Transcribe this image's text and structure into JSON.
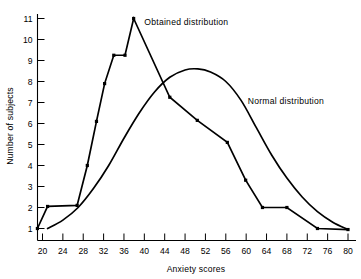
{
  "chart_data": {
    "type": "line",
    "title": "",
    "xlabel": "Anxiety scores",
    "ylabel": "Number of subjects",
    "xlim": [
      18,
      82
    ],
    "ylim": [
      0.2,
      11.6
    ],
    "grid": false,
    "legend_position": "inline-annotations",
    "xticks": [
      20,
      24,
      28,
      32,
      36,
      40,
      44,
      48,
      52,
      56,
      60,
      64,
      68,
      72,
      76,
      80
    ],
    "yticks": [
      1,
      2,
      3,
      4,
      5,
      6,
      7,
      8,
      9,
      10,
      11
    ],
    "xtick_labels": [
      "20",
      "24",
      "28",
      "32",
      "36",
      "40",
      "44",
      "48",
      "52",
      "56",
      "60",
      "64",
      "68",
      "72",
      "76",
      "80"
    ],
    "ytick_labels": [
      "1",
      "2",
      "3",
      "4",
      "5",
      "6",
      "7",
      "8",
      "9",
      "10",
      "11"
    ],
    "series": [
      {
        "name": "Obtained distribution",
        "style": "polyline",
        "markers": true,
        "color": "#000000",
        "points": [
          [
            19.0,
            1.0
          ],
          [
            21.0,
            2.05
          ],
          [
            26.8,
            2.1
          ],
          [
            28.8,
            4.0
          ],
          [
            30.6,
            6.1
          ],
          [
            32.2,
            7.9
          ],
          [
            34.0,
            9.25
          ],
          [
            36.2,
            9.25
          ],
          [
            37.9,
            11.0
          ],
          [
            45.0,
            7.25
          ],
          [
            50.4,
            6.15
          ],
          [
            56.3,
            5.1
          ],
          [
            59.9,
            3.3
          ],
          [
            63.2,
            2.0
          ],
          [
            68.0,
            2.0
          ],
          [
            74.0,
            1.0
          ],
          [
            80.0,
            0.95
          ]
        ]
      },
      {
        "name": "Normal distribution",
        "style": "smooth",
        "markers": false,
        "color": "#000000",
        "points": [
          [
            21.0,
            1.0
          ],
          [
            24.0,
            1.4
          ],
          [
            27.0,
            2.0
          ],
          [
            30.0,
            2.9
          ],
          [
            33.0,
            4.0
          ],
          [
            36.0,
            5.3
          ],
          [
            39.0,
            6.5
          ],
          [
            42.0,
            7.5
          ],
          [
            45.0,
            8.2
          ],
          [
            48.0,
            8.55
          ],
          [
            50.5,
            8.6
          ],
          [
            53.0,
            8.45
          ],
          [
            56.0,
            8.0
          ],
          [
            59.0,
            7.1
          ],
          [
            62.0,
            5.8
          ],
          [
            65.0,
            4.5
          ],
          [
            68.0,
            3.4
          ],
          [
            71.0,
            2.5
          ],
          [
            74.0,
            1.8
          ],
          [
            77.0,
            1.3
          ],
          [
            80.0,
            0.95
          ]
        ]
      }
    ],
    "annotations": [
      {
        "text": "Obtained distribution",
        "x_label": 40.0,
        "y_label": 10.85,
        "anchor": "start"
      },
      {
        "text": "Normal distribution",
        "x_label": 60.3,
        "y_label": 7.05,
        "anchor": "start"
      }
    ]
  }
}
